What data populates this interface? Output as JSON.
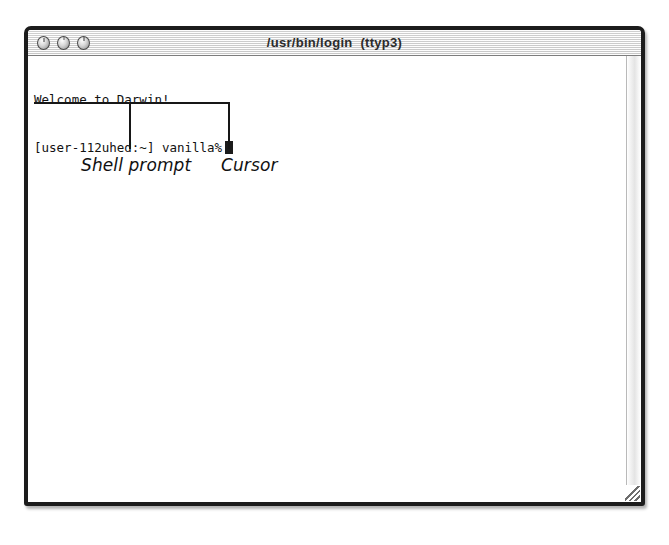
{
  "window": {
    "title": "/usr/bin/login  (ttyp3)",
    "controls": [
      {
        "name": "close",
        "label": "Close"
      },
      {
        "name": "minimize",
        "label": "Minimize"
      },
      {
        "name": "zoom",
        "label": "Zoom"
      }
    ],
    "scrollbar": {
      "orientation": "vertical"
    },
    "resize_grip": "resize-grip"
  },
  "terminal": {
    "lines": [
      "Welcome to Darwin!",
      "[user-112uhed:~] vanilla%"
    ],
    "welcome_line": "Welcome to Darwin!",
    "prompt_line": "[user-112uhed:~] vanilla%",
    "cursor": "block"
  },
  "annotations": [
    {
      "label": "Shell prompt",
      "target": "prompt_line"
    },
    {
      "label": "Cursor",
      "target": "cursor"
    }
  ],
  "annotation_labels": {
    "shell_prompt": "Shell prompt",
    "cursor": "Cursor"
  },
  "colors": {
    "window_frame": "#1c1c1c",
    "title_text": "#2b2b2b",
    "terminal_text": "#111111",
    "terminal_bg": "#ffffff",
    "cursor": "#1b1b1b",
    "annotation": "#111111",
    "page_bg": "#ffffff"
  }
}
